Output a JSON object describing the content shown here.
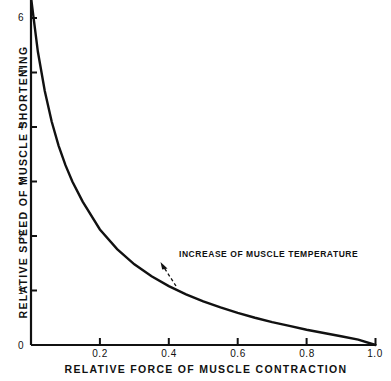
{
  "chart_data": {
    "type": "line",
    "title": "",
    "subtitle": "",
    "xlabel": "RELATIVE FORCE OF MUSCLE CONTRACTION",
    "ylabel": "RELATIVE SPEED OF MUSCLE SHORTENING",
    "xlim": [
      0,
      1.0
    ],
    "ylim": [
      0,
      6.3
    ],
    "grid": false,
    "legend": null,
    "xticks": [
      0,
      0.2,
      0.4,
      0.6,
      0.8,
      1.0
    ],
    "xticklabels": [
      "0",
      "0.2",
      "0.4",
      "0.6",
      "0.8",
      "1.0"
    ],
    "yticks": [
      0,
      1,
      2,
      3,
      4,
      5,
      6
    ],
    "yticklabels": [
      "0",
      "1",
      "2",
      "3",
      "4",
      "5",
      "6"
    ],
    "series": [
      {
        "name": "force-velocity curve",
        "x": [
          0.0,
          0.02,
          0.04,
          0.06,
          0.08,
          0.1,
          0.12,
          0.15,
          0.2,
          0.25,
          0.3,
          0.35,
          0.4,
          0.45,
          0.5,
          0.55,
          0.6,
          0.65,
          0.7,
          0.75,
          0.8,
          0.85,
          0.9,
          0.95,
          1.0
        ],
        "y": [
          6.38,
          5.38,
          4.66,
          4.1,
          3.66,
          3.3,
          3.0,
          2.63,
          2.12,
          1.76,
          1.48,
          1.26,
          1.08,
          0.93,
          0.8,
          0.69,
          0.59,
          0.5,
          0.42,
          0.35,
          0.28,
          0.22,
          0.16,
          0.1,
          0.0
        ]
      }
    ],
    "annotations": [
      {
        "text": "INCREASE OF MUSCLE TEMPERATURE",
        "arrow_style": "dashed-arrow",
        "arrow_from": [
          0.43,
          0.78
        ],
        "arrow_to": [
          0.4,
          1.28
        ]
      }
    ]
  },
  "axis": {
    "origin_label": "0",
    "x_ticks": [
      {
        "label": "0.2",
        "value": 0.2
      },
      {
        "label": "0.4",
        "value": 0.4
      },
      {
        "label": "0.6",
        "value": 0.6
      },
      {
        "label": "0.8",
        "value": 0.8
      },
      {
        "label": "1.0",
        "value": 1.0
      }
    ],
    "y_ticks": [
      {
        "label": "1",
        "value": 1
      },
      {
        "label": "2",
        "value": 2
      },
      {
        "label": "3",
        "value": 3
      },
      {
        "label": "4",
        "value": 4
      },
      {
        "label": "5",
        "value": 5
      },
      {
        "label": "6",
        "value": 6
      }
    ]
  },
  "style": {
    "curve_color": "#111111",
    "axis_color": "#111111",
    "background": "#ffffff"
  }
}
